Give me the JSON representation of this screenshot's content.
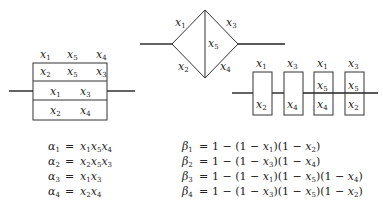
{
  "diagram1": {
    "name": "parallel-series-box",
    "rows": [
      {
        "labels": [
          "x1",
          "x5",
          "x4"
        ],
        "boxed": false
      },
      {
        "labels": [
          "x2",
          "x5",
          "x3"
        ],
        "boxed": true
      },
      {
        "labels": [
          "x1",
          "x3"
        ],
        "boxed": true
      },
      {
        "labels": [
          "x2",
          "x4"
        ],
        "boxed": true
      }
    ]
  },
  "diagram2": {
    "name": "bridge-network",
    "edges": {
      "top_left": "x1",
      "top_right": "x3",
      "center": "x5",
      "bottom_left": "x2",
      "bottom_right": "x4"
    }
  },
  "diagram3": {
    "name": "series-parallel-boxes",
    "boxes": [
      {
        "top": "x1",
        "inner": [
          "x2"
        ]
      },
      {
        "top": "x3",
        "inner": [
          "x4"
        ]
      },
      {
        "top": "x1",
        "inner": [
          "x5",
          "x4"
        ]
      },
      {
        "top": "x3",
        "inner": [
          "x5",
          "x2"
        ]
      }
    ]
  },
  "equations": {
    "alpha": [
      {
        "lhs": "α1",
        "rhs": "x1x5x4"
      },
      {
        "lhs": "α2",
        "rhs": "x2x5x3"
      },
      {
        "lhs": "α3",
        "rhs": "x1x3"
      },
      {
        "lhs": "α4",
        "rhs": "x2x4"
      }
    ],
    "beta": [
      {
        "lhs": "β1",
        "rhs": "1 − (1 − x1)(1 − x2)"
      },
      {
        "lhs": "β2",
        "rhs": "1 − (1 − x3)(1 − x4)"
      },
      {
        "lhs": "β3",
        "rhs": "1 − (1 − x1)(1 − x5)(1 − x4)"
      },
      {
        "lhs": "β4",
        "rhs": "1 − (1 − x3)(1 − x5)(1 − x2)"
      }
    ]
  }
}
